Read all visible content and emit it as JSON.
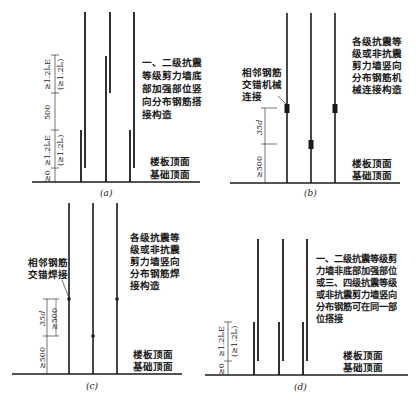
{
  "colors": {
    "ink": "#1a1a1a",
    "background": "#ffffff"
  },
  "panels": [
    {
      "id": "a",
      "caption": "(a)",
      "description_lines": [
        "一、二级抗震",
        "等级剪力墙底",
        "部加强部位竖",
        "向分布钢筋搭",
        "接构造"
      ],
      "floor_labels": [
        "楼板顶面",
        "基础顶面"
      ],
      "dimensions": [
        "≥1.2lₐE",
        "(≥1.2lₐ)",
        "500",
        "≥1.2lₐE",
        "(≥1.2lₐ)",
        "≥0"
      ]
    },
    {
      "id": "b",
      "caption": "(b)",
      "callout_lines": [
        "相邻钢筋",
        "交错机械",
        "连接"
      ],
      "description_lines": [
        "各级抗震等",
        "级或非抗震",
        "剪力墙竖向",
        "分布钢筋机",
        "械连接构造"
      ],
      "floor_labels": [
        "楼板顶面",
        "基础顶面"
      ],
      "dimensions": [
        "35d",
        "≥500"
      ]
    },
    {
      "id": "c",
      "caption": "(c)",
      "callout_lines": [
        "相邻钢筋",
        "交错焊接"
      ],
      "description_lines": [
        "各级抗震等",
        "级或非抗震",
        "剪力墙竖向",
        "分布钢筋焊",
        "接构造"
      ],
      "floor_labels": [
        "楼板顶面",
        "基础顶面"
      ],
      "dimensions": [
        "35d",
        "≥500",
        "≥500"
      ]
    },
    {
      "id": "d",
      "caption": "(d)",
      "description_lines": [
        "一、二级抗震等级剪",
        "力墙非底部加强部位",
        "或三、四级抗震等级",
        "或非抗震剪力墙竖向",
        "分布钢筋可在同一部",
        "位搭接"
      ],
      "floor_labels": [
        "楼板顶面",
        "基础顶面"
      ],
      "dimensions": [
        "≥1.2lₐE",
        "(≥1.2lₐ)",
        "≥0"
      ]
    }
  ]
}
